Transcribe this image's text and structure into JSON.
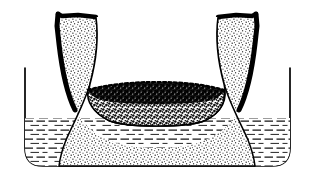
{
  "figure": {
    "type": "technical-line-drawing",
    "caption": "",
    "background_color": "#ffffff",
    "line_color": "#000000",
    "width": 314,
    "height": 183
  },
  "elements": {
    "outer_container": {
      "name": "liquid container",
      "stroke_color": "#000000",
      "stroke_width": 1.6,
      "fill": "none",
      "left_wall_x": 25,
      "right_wall_x": 290,
      "rim_y": 68,
      "floor_y": 166,
      "corner_radius": 18
    },
    "liquid": {
      "name": "liquid bath",
      "surface_y": 118,
      "hatch_color": "#3a3a3a",
      "hatch_style": "horizontal-dashes",
      "hatch_spacing_px": 9,
      "fill": "#ffffff"
    },
    "vessel": {
      "name": "U-shaped porous vessel",
      "body_fill_pattern": "fine-stipple",
      "body_fill_color": "#ffffff",
      "stipple_color": "#262626",
      "outer_rim_stroke": "#000000",
      "outer_rim_width": 4.5,
      "inner_wall_stroke": "#000000",
      "inner_wall_width": 1.4,
      "left_rim_x": 58,
      "right_rim_x": 256,
      "rim_top_y": 14,
      "base_y": 166,
      "cavity_bottom_y": 108
    },
    "granular_bed": {
      "name": "dark granular sediment",
      "color": "#101010",
      "texture": "coarse-speckle",
      "top_y": 92,
      "bottom_y": 108,
      "left_x": 113,
      "right_x": 200
    }
  }
}
